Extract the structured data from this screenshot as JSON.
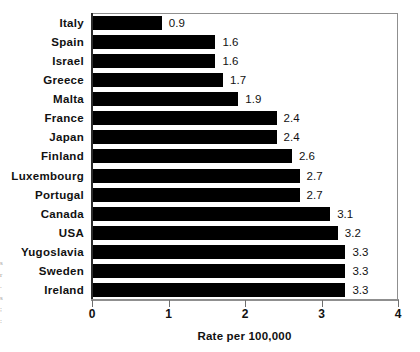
{
  "chart_data": {
    "type": "bar",
    "orientation": "horizontal",
    "title": "",
    "xlabel": "Rate per 100,000",
    "ylabel": "",
    "xlim": [
      0,
      4
    ],
    "xticks": [
      0,
      1,
      2,
      3,
      4
    ],
    "xtick_labels": [
      "0",
      "1",
      "2",
      "3",
      "4"
    ],
    "grid": false,
    "legend": null,
    "bar_color": "#000000",
    "categories": [
      "Italy",
      "Spain",
      "Israel",
      "Greece",
      "Malta",
      "France",
      "Japan",
      "Finland",
      "Luxembourg",
      "Portugal",
      "Canada",
      "USA",
      "Yugoslavia",
      "Sweden",
      "Ireland"
    ],
    "values": [
      0.9,
      1.6,
      1.6,
      1.7,
      1.9,
      2.4,
      2.4,
      2.6,
      2.7,
      2.7,
      3.1,
      3.2,
      3.3,
      3.3,
      3.3
    ],
    "value_labels": [
      "0.9",
      "1.6",
      "1.6",
      "1.7",
      "1.9",
      "2.4",
      "2.4",
      "2.6",
      "2.7",
      "2.7",
      "3.1",
      "3.2",
      "3.3",
      "3.3",
      "3.3"
    ]
  },
  "margin_note": {
    "lines": [
      "s",
      "r",
      ".",
      "s",
      ";",
      ":"
    ]
  }
}
